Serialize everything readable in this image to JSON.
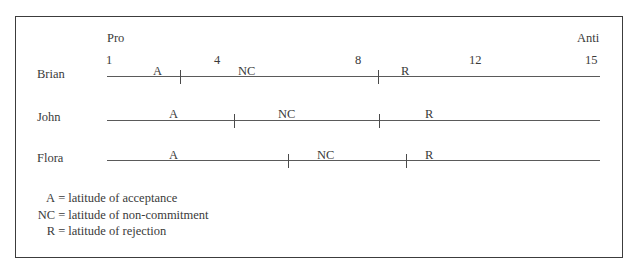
{
  "diagram": {
    "scale": {
      "left_label": "Pro",
      "right_label": "Anti",
      "ticks": [
        {
          "label": "1",
          "value": 1
        },
        {
          "label": "4",
          "value": 4
        },
        {
          "label": "8",
          "value": 8
        },
        {
          "label": "12",
          "value": 12
        },
        {
          "label": "15",
          "value": 15
        }
      ]
    },
    "people": [
      {
        "name": "Brian",
        "segments": [
          {
            "label": "A"
          },
          {
            "label": "NC"
          },
          {
            "label": "R"
          }
        ]
      },
      {
        "name": "John",
        "segments": [
          {
            "label": "A"
          },
          {
            "label": "NC"
          },
          {
            "label": "R"
          }
        ]
      },
      {
        "name": "Flora",
        "segments": [
          {
            "label": "A"
          },
          {
            "label": "NC"
          },
          {
            "label": "R"
          }
        ]
      }
    ],
    "legend": [
      {
        "key": "A",
        "eq": "=",
        "text": "latitude of acceptance"
      },
      {
        "key": "NC",
        "eq": "=",
        "text": "latitude of non-commitment"
      },
      {
        "key": "R",
        "eq": "=",
        "text": "latitude of rejection"
      }
    ]
  }
}
